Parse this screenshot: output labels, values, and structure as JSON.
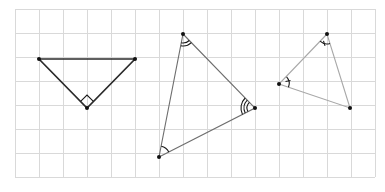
{
  "diagram": {
    "type": "geometry-triangles-on-grid",
    "grid": {
      "x0": 15,
      "y0": 9,
      "cell": 24,
      "cols": 15,
      "rows": 7,
      "color": "#d9d9d9"
    },
    "triangles": [
      {
        "id": "triangle-1",
        "vertices": [
          [
            39,
            59
          ],
          [
            135,
            59
          ],
          [
            87,
            108
          ]
        ],
        "stroke": "#2b2b2b",
        "angle_marks": [
          {
            "vertex": 2,
            "type": "right-angle"
          }
        ]
      },
      {
        "id": "triangle-2",
        "vertices": [
          [
            183,
            34
          ],
          [
            255,
            108
          ],
          [
            159,
            157
          ]
        ],
        "stroke": "#6e6e6e",
        "angle_marks": [
          {
            "vertex": 0,
            "type": "double-arc"
          },
          {
            "vertex": 1,
            "type": "triple-arc"
          },
          {
            "vertex": 2,
            "type": "single-arc"
          }
        ]
      },
      {
        "id": "triangle-3",
        "vertices": [
          [
            327,
            34
          ],
          [
            279,
            84
          ],
          [
            350,
            108
          ]
        ],
        "stroke": "#a8a8a8",
        "angle_marks": [
          {
            "vertex": 0,
            "type": "arc-with-tick"
          },
          {
            "vertex": 1,
            "type": "arc-with-tick"
          }
        ]
      }
    ]
  }
}
